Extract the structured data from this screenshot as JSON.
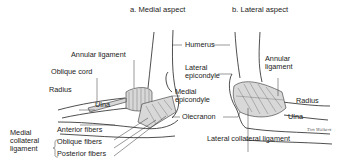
{
  "titles": {
    "medial": "a. Medial aspect",
    "lateral": "b. Lateral aspect"
  },
  "medial_labels": {
    "annular_ligament": "Annular ligament",
    "oblique_cord": "Oblique cord",
    "radius": "Radius",
    "ulna": "Ulna",
    "mcl_group": [
      "Medial",
      "collateral",
      "ligament"
    ],
    "anterior_fibers": "Anterior fibers",
    "oblique_fibers": "Oblique fibers",
    "posterior_fibers": "Posterior fibers"
  },
  "center_labels": {
    "humerus": "Humerus",
    "lateral_epicondyle": [
      "Lateral",
      "epicondyle"
    ],
    "medial_epicondyle": [
      "Medial",
      "epicondyle"
    ],
    "olecranon": "Olecranon"
  },
  "lateral_labels": {
    "annular_ligament": [
      "Annular",
      "ligament"
    ],
    "radius": "Radius",
    "ulna": "Ulna",
    "lateral_collateral_ligament": "Lateral collateral ligament"
  },
  "signature": "Tim Walters"
}
